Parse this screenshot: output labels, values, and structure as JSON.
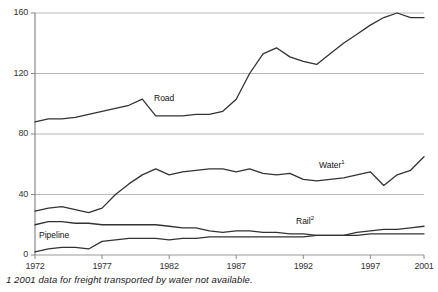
{
  "chart_data": {
    "type": "line",
    "title": "",
    "subtitle": "",
    "xlabel": "",
    "ylabel": "",
    "xlim": [
      1972,
      2001
    ],
    "ylim": [
      0,
      160
    ],
    "yticks": [
      0,
      40,
      80,
      120,
      160
    ],
    "xticks": [
      1972,
      1977,
      1982,
      1987,
      1992,
      1997,
      2001
    ],
    "grid": "horizontal",
    "legend": "inline-labels",
    "x": [
      1972,
      1973,
      1974,
      1975,
      1976,
      1977,
      1978,
      1979,
      1980,
      1981,
      1982,
      1983,
      1984,
      1985,
      1986,
      1987,
      1988,
      1989,
      1990,
      1991,
      1992,
      1993,
      1994,
      1995,
      1996,
      1997,
      1998,
      1999,
      2000,
      2001
    ],
    "series": [
      {
        "name": "Road",
        "label": "Road",
        "values": [
          88,
          90,
          90,
          91,
          93,
          95,
          97,
          99,
          103,
          92,
          92,
          92,
          93,
          93,
          95,
          103,
          120,
          133,
          137,
          131,
          128,
          126,
          133,
          140,
          146,
          152,
          157,
          160,
          157,
          157
        ]
      },
      {
        "name": "Water",
        "label": "Water",
        "footnote_marker": "1",
        "values": [
          29,
          31,
          32,
          30,
          28,
          31,
          40,
          47,
          53,
          57,
          53,
          55,
          56,
          57,
          57,
          55,
          57,
          54,
          53,
          54,
          50,
          49,
          50,
          51,
          53,
          55,
          46,
          53,
          56,
          65
        ]
      },
      {
        "name": "Pipeline",
        "label": "Pipeline",
        "values": [
          20,
          22,
          22,
          21,
          21,
          20,
          20,
          20,
          20,
          20,
          19,
          18,
          18,
          16,
          15,
          16,
          16,
          15,
          15,
          14,
          14,
          13,
          13,
          13,
          13,
          14,
          14,
          14,
          14,
          14
        ]
      },
      {
        "name": "Rail",
        "label": "Rail",
        "footnote_marker": "2",
        "values": [
          2,
          4,
          5,
          5,
          4,
          9,
          10,
          11,
          11,
          11,
          10,
          11,
          11,
          12,
          12,
          12,
          12,
          12,
          12,
          12,
          12,
          13,
          13,
          13,
          15,
          16,
          17,
          17,
          18,
          19
        ]
      }
    ],
    "footnote": "1 2001 data for freight transported by water not available.",
    "series_label_positions": [
      {
        "name": "Road",
        "x": 153,
        "y": 93
      },
      {
        "name": "Water",
        "x": 318,
        "y": 159
      },
      {
        "name": "Rail",
        "x": 295,
        "y": 215
      },
      {
        "name": "Pipeline",
        "x": 38,
        "y": 230
      }
    ],
    "colors": {
      "line": "#333333",
      "grid": "#b8b8b8",
      "axis": "#999999",
      "text": "#333333",
      "background": "#ffffff"
    }
  }
}
